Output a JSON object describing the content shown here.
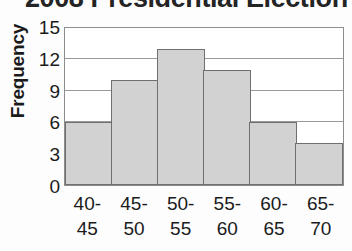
{
  "chart_data": {
    "type": "bar",
    "title": "2008 Presidential Election",
    "xlabel": "",
    "ylabel": "Frequency",
    "categories": [
      "40-45",
      "45-50",
      "50-55",
      "55-60",
      "60-65",
      "65-70"
    ],
    "category_lines": [
      [
        "40-",
        "45"
      ],
      [
        "45-",
        "50"
      ],
      [
        "50-",
        "55"
      ],
      [
        "55-",
        "60"
      ],
      [
        "60-",
        "65"
      ],
      [
        "65-",
        "70"
      ]
    ],
    "values": [
      6,
      10,
      13,
      11,
      6,
      4
    ],
    "ylim": [
      0,
      15
    ],
    "yticks": [
      0,
      3,
      6,
      9,
      12,
      15
    ],
    "gridlines": [
      3,
      6,
      9,
      12
    ],
    "grid": true,
    "legend": false,
    "bar_fill_color": "#d2d2d2",
    "bar_border_color": "#6f6f6f",
    "grid_color": "#9a9a9a",
    "plot_border_color": "#8d8d8d",
    "background_color": "#fdfdfd",
    "text_color": "#1b1b1b"
  }
}
